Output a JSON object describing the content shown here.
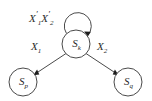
{
  "diagram": {
    "type": "state-transition-diagram",
    "background_color": "#ffffff",
    "stroke_color": "#4a4a4a",
    "arrow_color": "#1d1d1d",
    "text_color": "#2b2b2b",
    "nodes": [
      {
        "id": "Sk",
        "label_base": "S",
        "label_sub": "k",
        "cx": 76,
        "cy": 44,
        "r": 14,
        "role": "current-state"
      },
      {
        "id": "Sp",
        "label_base": "S",
        "label_sub": "p",
        "cx": 23,
        "cy": 82,
        "r": 14,
        "role": "target-state-left"
      },
      {
        "id": "Sq",
        "label_base": "S",
        "label_sub": "q",
        "cx": 128,
        "cy": 82,
        "r": 14,
        "role": "target-state-right"
      }
    ],
    "edges": [
      {
        "id": "self-loop",
        "from": "Sk",
        "to": "Sk",
        "kind": "self-loop",
        "label_parts": [
          {
            "base": "X",
            "prime": "′",
            "sub": "1"
          },
          {
            "base": "X",
            "prime": "′",
            "sub": "2"
          }
        ],
        "label_text": "X′1X′2"
      },
      {
        "id": "edge-k-to-p",
        "from": "Sk",
        "to": "Sp",
        "kind": "directed",
        "label_parts": [
          {
            "base": "X",
            "prime": "",
            "sub": "1"
          }
        ],
        "label_text": "X1"
      },
      {
        "id": "edge-k-to-q",
        "from": "Sk",
        "to": "Sq",
        "kind": "directed",
        "label_parts": [
          {
            "base": "X",
            "prime": "",
            "sub": "2"
          }
        ],
        "label_text": "X2"
      }
    ],
    "labels": {
      "node_k_base": "S",
      "node_k_sub": "k",
      "node_p_base": "S",
      "node_p_sub": "p",
      "node_q_base": "S",
      "node_q_sub": "q",
      "loop_x1_base": "X",
      "loop_x1_prime": "′",
      "loop_x1_sub": "1",
      "loop_x2_base": "X",
      "loop_x2_prime": "′",
      "loop_x2_sub": "2",
      "edge_left_base": "X",
      "edge_left_sub": "1",
      "edge_right_base": "X",
      "edge_right_sub": "2"
    }
  }
}
